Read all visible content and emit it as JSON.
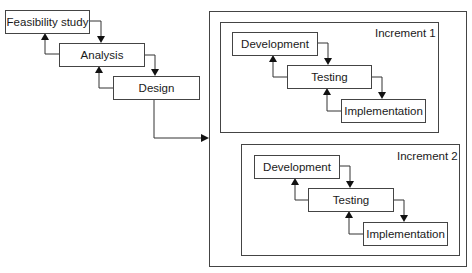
{
  "diagram": {
    "sequential_phases": [
      {
        "id": "feasibility",
        "label": "Feasibility study"
      },
      {
        "id": "analysis",
        "label": "Analysis"
      },
      {
        "id": "design",
        "label": "Design"
      }
    ],
    "increments": [
      {
        "label": "Increment 1",
        "stages": [
          {
            "id": "dev1",
            "label": "Development"
          },
          {
            "id": "test1",
            "label": "Testing"
          },
          {
            "id": "impl1",
            "label": "Implementation"
          }
        ]
      },
      {
        "label": "Increment 2",
        "stages": [
          {
            "id": "dev2",
            "label": "Development"
          },
          {
            "id": "test2",
            "label": "Testing"
          },
          {
            "id": "impl2",
            "label": "Implementation"
          }
        ]
      }
    ],
    "edges": [
      {
        "from": "feasibility",
        "to": "analysis",
        "type": "forward"
      },
      {
        "from": "analysis",
        "to": "feasibility",
        "type": "feedback"
      },
      {
        "from": "analysis",
        "to": "design",
        "type": "forward"
      },
      {
        "from": "design",
        "to": "analysis",
        "type": "feedback"
      },
      {
        "from": "design",
        "to": "increments-container",
        "type": "forward"
      },
      {
        "from": "dev1",
        "to": "test1",
        "type": "forward"
      },
      {
        "from": "test1",
        "to": "dev1",
        "type": "feedback"
      },
      {
        "from": "test1",
        "to": "impl1",
        "type": "forward"
      },
      {
        "from": "impl1",
        "to": "test1",
        "type": "feedback"
      },
      {
        "from": "dev2",
        "to": "test2",
        "type": "forward"
      },
      {
        "from": "test2",
        "to": "dev2",
        "type": "feedback"
      },
      {
        "from": "test2",
        "to": "impl2",
        "type": "forward"
      },
      {
        "from": "impl2",
        "to": "test2",
        "type": "feedback"
      }
    ],
    "colors": {
      "stroke": "#444444",
      "arrowhead": "#111111",
      "text": "#1a1a1a",
      "background": "#ffffff"
    }
  }
}
